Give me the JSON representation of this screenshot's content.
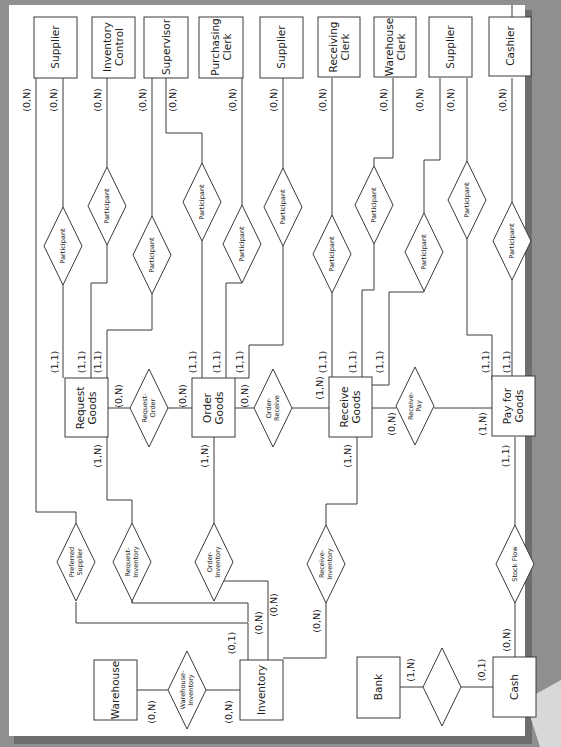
{
  "diagram": {
    "orientation": "rotated 90 degrees counter-clockwise"
  },
  "entities": {
    "top": [
      {
        "id": "supplier1",
        "label": [
          "Supplier"
        ],
        "cardinality": "(0,N)",
        "outer_cardinality": "(0,N)"
      },
      {
        "id": "inventory_control",
        "label": [
          "Inventory",
          "Control"
        ],
        "cardinality": "(0,N)"
      },
      {
        "id": "supervisor",
        "label": [
          "Supervisor"
        ],
        "cardinality": "(0,N)",
        "outer_cardinality": "(0,N)"
      },
      {
        "id": "purchasing_clerk",
        "label": [
          "Purchasing",
          "Clerk"
        ],
        "cardinality": "(0,N)"
      },
      {
        "id": "supplier2",
        "label": [
          "Supplier"
        ],
        "cardinality": "(0,N)"
      },
      {
        "id": "receiving_clerk",
        "label": [
          "Receiving",
          "Clerk"
        ],
        "cardinality": "(0,N)"
      },
      {
        "id": "warehouse_clerk",
        "label": [
          "Warehouse",
          "Clerk"
        ],
        "cardinality": "(0,N)",
        "outer_cardinality": "(0,N)"
      },
      {
        "id": "supplier3",
        "label": [
          "Supplier"
        ],
        "cardinality": "(0,N)"
      },
      {
        "id": "cashier",
        "label": [
          "Cashier"
        ],
        "cardinality": "(0,N)"
      }
    ],
    "events": [
      {
        "id": "request_goods",
        "label": [
          "Request",
          "Goods"
        ]
      },
      {
        "id": "order_goods",
        "label": [
          "Order",
          "Goods"
        ]
      },
      {
        "id": "receive_goods",
        "label": [
          "Receive",
          "Goods"
        ]
      },
      {
        "id": "pay_for_goods",
        "label": [
          "Pay for",
          "Goods"
        ]
      }
    ],
    "bottom": [
      {
        "id": "warehouse",
        "label": [
          "Warehouse"
        ]
      },
      {
        "id": "inventory",
        "label": [
          "Inventory"
        ]
      },
      {
        "id": "bank",
        "label": [
          "Bank"
        ]
      },
      {
        "id": "cash",
        "label": [
          "Cash"
        ]
      }
    ]
  },
  "relationships": {
    "participant": "Participant",
    "request_order": [
      "Request-",
      "Order"
    ],
    "order_receive": [
      "Order-",
      "Receive"
    ],
    "receive_pay": [
      "Receive-",
      "Pay"
    ],
    "preferred_supplier": [
      "Preferred",
      "Supplier"
    ],
    "request_inventory": [
      "Request-",
      "Inventory"
    ],
    "order_inventory": [
      "Order-",
      "Inventory"
    ],
    "receive_inventory": [
      "Receive-",
      "Inventory"
    ],
    "stock_flow": [
      "Stock Flow"
    ],
    "warehouse_inventory": [
      "Warehouse-",
      "Inventory"
    ],
    "bank_cash": [
      ""
    ]
  },
  "cardinalities": {
    "request_goods_participants": [
      "(1,1)",
      "(1,1)",
      "(1,1)"
    ],
    "order_goods_participants": [
      "(1,1)",
      "(1,1)",
      "(1,1)"
    ],
    "receive_goods_participants": [
      "(1,1)",
      "(1,1)",
      "(1,1)"
    ],
    "pay_for_goods_participants": [
      "(1,1)",
      "(1,1)"
    ],
    "request_goods_request_order": "(0,N)",
    "order_goods_request_order": "(0,N)",
    "order_goods_order_receive": "(0,N)",
    "receive_goods_order_receive": "(1,N)",
    "receive_goods_receive_pay": "(0,N)",
    "pay_for_goods_receive_pay": "(1,N)",
    "request_goods_inventory": "(1,N)",
    "order_goods_inventory": "(1,N)",
    "receive_goods_inventory": "(1,N)",
    "pay_for_goods_stock_flow": "(1,1)",
    "inventory_preferred_supplier": "(0,1)",
    "inventory_request_inventory": "(0,N)",
    "inventory_order_inventory": "(0,N)",
    "inventory_receive_inventory": "(0,N)",
    "inventory_warehouse_inventory": "(0,N)",
    "warehouse_warehouse_inventory": "(0,N)",
    "bank_cash_bank": "(1,N)",
    "bank_cash_cash": "(0,1)",
    "cash_stock_flow": "(0,N)"
  }
}
